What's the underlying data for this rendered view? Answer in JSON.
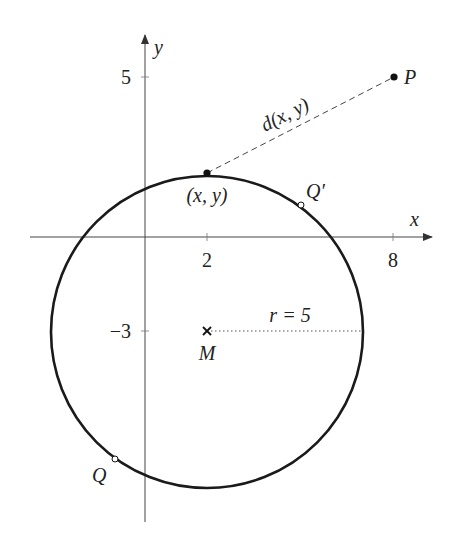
{
  "figure": {
    "axes": {
      "x_label": "x",
      "y_label": "y",
      "x_ticks": [
        {
          "value": 2,
          "label": "2"
        },
        {
          "value": 8,
          "label": "8"
        }
      ],
      "y_ticks": [
        {
          "value": 5,
          "label": "5"
        },
        {
          "value": -3,
          "label": "−3"
        }
      ]
    },
    "circle": {
      "center_label": "M",
      "center": [
        2,
        -3
      ],
      "radius": 5,
      "radius_label": "r = 5"
    },
    "points": {
      "P": {
        "label": "P",
        "coords": [
          8,
          5
        ]
      },
      "xy": {
        "label": "(x, y)",
        "coords": [
          2,
          2
        ]
      },
      "Q_prime": {
        "label": "Q′"
      },
      "Q": {
        "label": "Q"
      }
    },
    "distance_label": "d(x, y)",
    "colors": {
      "curve": "#1a1a1a",
      "axes": "#333333",
      "text": "#222222"
    }
  }
}
